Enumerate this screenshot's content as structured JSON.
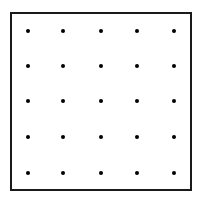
{
  "diagram": {
    "type": "dot-grid",
    "rows": 5,
    "cols": 5,
    "dot_color": "#000000",
    "border_color": "#1a1a1a",
    "dot_x": [
      28,
      63,
      101,
      137,
      174
    ],
    "dot_y": [
      31,
      66,
      101,
      137,
      173
    ]
  }
}
